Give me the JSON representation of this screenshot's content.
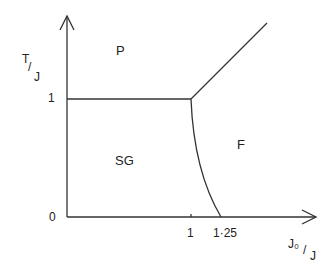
{
  "diagram": {
    "type": "phase-diagram",
    "y_axis_label_num": "T",
    "y_axis_label_den": "J",
    "x_axis_label_num": "J₀",
    "x_axis_label_den": "J",
    "y_ticks": [
      "0",
      "1"
    ],
    "x_ticks": [
      "1",
      "1·25"
    ],
    "regions": {
      "paramagnetic": "P",
      "spin_glass": "SG",
      "ferromagnetic": "F"
    }
  }
}
